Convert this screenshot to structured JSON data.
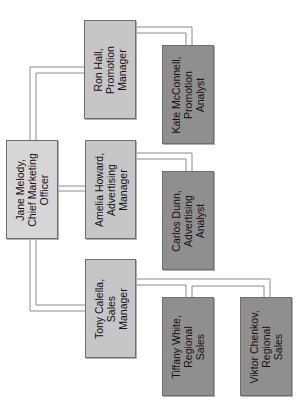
{
  "diagram": {
    "type": "org-chart",
    "orientation": "rotated-90-ccw",
    "colors": {
      "executive_fill": "#d6d6d6",
      "manager_fill": "#c6c6c6",
      "analyst_fill": "#8f8f8f",
      "border": "#6e6e6e",
      "connector": "#8a8a8a"
    },
    "nodes": [
      {
        "id": "jane",
        "label": "Jane Melody,\nChief Marketing\nOfficer",
        "level": 0,
        "parent": null
      },
      {
        "id": "ron",
        "label": "Ron Hall,\nPromotion\nManager",
        "level": 1,
        "parent": "jane"
      },
      {
        "id": "amelia",
        "label": "Amelia Howard,\nAdvertising\nManager",
        "level": 1,
        "parent": "jane"
      },
      {
        "id": "tony",
        "label": "Tony Calella,\nSales\nManager",
        "level": 1,
        "parent": "jane"
      },
      {
        "id": "kate",
        "label": "Kate McConnell,\nPromotion\nAnalyst",
        "level": 2,
        "parent": "ron"
      },
      {
        "id": "carlos",
        "label": "Carlos Dunn,\nAdvertising\nAnalyst",
        "level": 2,
        "parent": "amelia"
      },
      {
        "id": "tiffany",
        "label": "Tiffany White,\nRegional\nSales",
        "level": 2,
        "parent": "tony"
      },
      {
        "id": "viktor",
        "label": "Viktor Chenkov,\nRegional\nSales",
        "level": 2,
        "parent": "tony"
      }
    ]
  }
}
